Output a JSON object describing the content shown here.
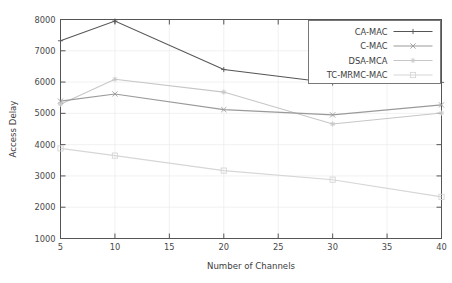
{
  "chart_data": {
    "type": "line",
    "title": "",
    "xlabel": "Number of Channels",
    "ylabel": "Access Delay",
    "x": [
      5,
      10,
      20,
      30,
      40
    ],
    "xlim": [
      5,
      40
    ],
    "ylim": [
      1000,
      8000
    ],
    "xticks": [
      "5",
      "10",
      "15",
      "20",
      "25",
      "30",
      "35",
      "40"
    ],
    "xtick_values": [
      5,
      10,
      15,
      20,
      25,
      30,
      35,
      40
    ],
    "yticks": [
      "1000",
      "2000",
      "3000",
      "4000",
      "5000",
      "6000",
      "7000",
      "8000"
    ],
    "ytick_values": [
      1000,
      2000,
      3000,
      4000,
      5000,
      6000,
      7000,
      8000
    ],
    "grid": true,
    "legend_position": "top-right",
    "series": [
      {
        "name": "CA-MAC",
        "color": "#555555",
        "marker": "plus",
        "values": [
          7320,
          7950,
          6400,
          5970,
          5990
        ]
      },
      {
        "name": "C-MAC",
        "color": "#9a9a9a",
        "marker": "cross",
        "values": [
          5390,
          5620,
          5120,
          4950,
          5270
        ]
      },
      {
        "name": "DSA-MCA",
        "color": "#c6c6c6",
        "marker": "star",
        "values": [
          5290,
          6090,
          5680,
          4660,
          5010
        ]
      },
      {
        "name": "TC-MRMC-MAC",
        "color": "#d6d6d6",
        "marker": "square",
        "values": [
          3880,
          3650,
          3170,
          2880,
          2330
        ]
      }
    ]
  }
}
